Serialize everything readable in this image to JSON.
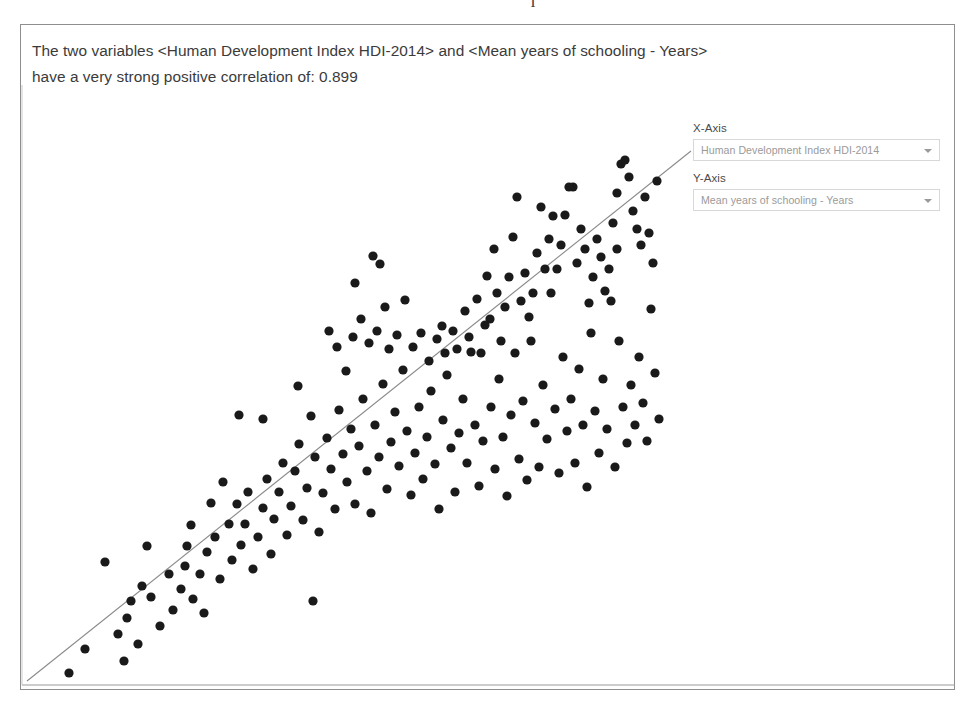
{
  "scan_artifact": "I",
  "header": {
    "correlation_text": "The two variables <Human Development Index HDI-2014> and <Mean years of schooling - Years> have a very strong positive correlation of: 0.899",
    "variable_x": "Human Development Index HDI-2014",
    "variable_y": "Mean years of schooling - Years",
    "correlation_value": "0.899",
    "correlation_strength": "very strong positive"
  },
  "controls": {
    "x_axis": {
      "label": "X-Axis",
      "selected": "Human Development Index HDI-2014",
      "arrow_icon": "chevron-down-icon"
    },
    "y_axis": {
      "label": "Y-Axis",
      "selected": "Mean years of schooling - Years",
      "arrow_icon": "chevron-down-icon"
    }
  },
  "colors": {
    "panel_border": "#8e8e8e",
    "text": "#3b3b3b",
    "marker": "#1a1a1a",
    "trendline": "#8a8a8a",
    "axis": "#9a9a9a",
    "select_border": "#d8d8d8",
    "select_text": "#9a9a9a"
  },
  "chart_data": {
    "type": "scatter",
    "title": "",
    "xlabel": "Human Development Index HDI-2014",
    "ylabel": "Mean years of schooling - Years",
    "correlation": 0.899,
    "grid": false,
    "legend": false,
    "axes": {
      "x_axis_visible": true,
      "y_axis_visible": true,
      "tick_labels": false
    },
    "marker": {
      "shape": "circle",
      "radius_px": 4.6,
      "color": "#1a1a1a"
    },
    "trendline": {
      "visible": true,
      "color": "#8a8a8a",
      "width_px": 1.1,
      "px_start": [
        26,
        680
      ],
      "px_end": [
        690,
        150
      ]
    },
    "plot_px_box": {
      "left": 20,
      "top": 84,
      "right": 955,
      "bottom": 685
    },
    "n_points": 196,
    "points_px": [
      [
        68,
        672
      ],
      [
        84,
        648
      ],
      [
        123,
        660
      ],
      [
        126,
        617
      ],
      [
        130,
        600
      ],
      [
        104,
        561
      ],
      [
        117,
        633
      ],
      [
        137,
        643
      ],
      [
        141,
        585
      ],
      [
        150,
        596
      ],
      [
        159,
        625
      ],
      [
        146,
        545
      ],
      [
        168,
        573
      ],
      [
        172,
        609
      ],
      [
        180,
        588
      ],
      [
        184,
        565
      ],
      [
        186,
        545
      ],
      [
        190,
        524
      ],
      [
        192,
        598
      ],
      [
        199,
        573
      ],
      [
        203,
        612
      ],
      [
        206,
        551
      ],
      [
        210,
        502
      ],
      [
        214,
        536
      ],
      [
        219,
        578
      ],
      [
        222,
        481
      ],
      [
        228,
        523
      ],
      [
        231,
        559
      ],
      [
        236,
        503
      ],
      [
        240,
        544
      ],
      [
        244,
        523
      ],
      [
        238,
        414
      ],
      [
        247,
        491
      ],
      [
        252,
        568
      ],
      [
        257,
        536
      ],
      [
        262,
        507
      ],
      [
        266,
        478
      ],
      [
        270,
        553
      ],
      [
        273,
        518
      ],
      [
        278,
        491
      ],
      [
        262,
        418
      ],
      [
        282,
        462
      ],
      [
        286,
        534
      ],
      [
        290,
        505
      ],
      [
        294,
        470
      ],
      [
        298,
        443
      ],
      [
        302,
        519
      ],
      [
        306,
        487
      ],
      [
        310,
        415
      ],
      [
        297,
        385
      ],
      [
        314,
        456
      ],
      [
        318,
        531
      ],
      [
        312,
        600
      ],
      [
        322,
        492
      ],
      [
        326,
        437
      ],
      [
        330,
        468
      ],
      [
        334,
        508
      ],
      [
        338,
        409
      ],
      [
        342,
        453
      ],
      [
        346,
        481
      ],
      [
        350,
        428
      ],
      [
        354,
        503
      ],
      [
        345,
        370
      ],
      [
        358,
        445
      ],
      [
        362,
        398
      ],
      [
        366,
        470
      ],
      [
        370,
        512
      ],
      [
        374,
        424
      ],
      [
        378,
        456
      ],
      [
        382,
        383
      ],
      [
        372,
        255
      ],
      [
        386,
        488
      ],
      [
        390,
        441
      ],
      [
        394,
        411
      ],
      [
        398,
        465
      ],
      [
        354,
        282
      ],
      [
        402,
        369
      ],
      [
        406,
        430
      ],
      [
        410,
        494
      ],
      [
        414,
        452
      ],
      [
        418,
        406
      ],
      [
        379,
        263
      ],
      [
        422,
        478
      ],
      [
        426,
        436
      ],
      [
        430,
        390
      ],
      [
        434,
        463
      ],
      [
        438,
        508
      ],
      [
        442,
        419
      ],
      [
        446,
        374
      ],
      [
        450,
        447
      ],
      [
        404,
        299
      ],
      [
        454,
        491
      ],
      [
        458,
        432
      ],
      [
        462,
        398
      ],
      [
        466,
        462
      ],
      [
        441,
        325
      ],
      [
        470,
        351
      ],
      [
        474,
        424
      ],
      [
        478,
        485
      ],
      [
        482,
        440
      ],
      [
        486,
        275
      ],
      [
        490,
        406
      ],
      [
        494,
        468
      ],
      [
        498,
        378
      ],
      [
        502,
        436
      ],
      [
        489,
        318
      ],
      [
        506,
        495
      ],
      [
        510,
        414
      ],
      [
        514,
        352
      ],
      [
        518,
        458
      ],
      [
        522,
        400
      ],
      [
        526,
        479
      ],
      [
        493,
        248
      ],
      [
        530,
        340
      ],
      [
        534,
        422
      ],
      [
        538,
        466
      ],
      [
        542,
        384
      ],
      [
        546,
        438
      ],
      [
        550,
        292
      ],
      [
        554,
        408
      ],
      [
        558,
        472
      ],
      [
        562,
        356
      ],
      [
        566,
        430
      ],
      [
        570,
        398
      ],
      [
        552,
        215
      ],
      [
        574,
        462
      ],
      [
        578,
        368
      ],
      [
        582,
        424
      ],
      [
        586,
        486
      ],
      [
        590,
        332
      ],
      [
        572,
        186
      ],
      [
        594,
        410
      ],
      [
        598,
        452
      ],
      [
        602,
        378
      ],
      [
        606,
        428
      ],
      [
        610,
        300
      ],
      [
        614,
        466
      ],
      [
        618,
        340
      ],
      [
        622,
        406
      ],
      [
        626,
        442
      ],
      [
        596,
        238
      ],
      [
        630,
        384
      ],
      [
        634,
        424
      ],
      [
        638,
        356
      ],
      [
        642,
        402
      ],
      [
        616,
        192
      ],
      [
        646,
        440
      ],
      [
        650,
        308
      ],
      [
        654,
        372
      ],
      [
        658,
        418
      ],
      [
        620,
        163
      ],
      [
        624,
        159
      ],
      [
        628,
        176
      ],
      [
        632,
        210
      ],
      [
        636,
        228
      ],
      [
        640,
        244
      ],
      [
        644,
        196
      ],
      [
        648,
        232
      ],
      [
        652,
        262
      ],
      [
        656,
        180
      ],
      [
        612,
        222
      ],
      [
        616,
        248
      ],
      [
        608,
        268
      ],
      [
        604,
        290
      ],
      [
        600,
        256
      ],
      [
        592,
        276
      ],
      [
        588,
        302
      ],
      [
        584,
        248
      ],
      [
        580,
        228
      ],
      [
        576,
        262
      ],
      [
        568,
        186
      ],
      [
        564,
        214
      ],
      [
        560,
        244
      ],
      [
        556,
        268
      ],
      [
        548,
        238
      ],
      [
        544,
        268
      ],
      [
        540,
        206
      ],
      [
        536,
        252
      ],
      [
        532,
        292
      ],
      [
        528,
        316
      ],
      [
        524,
        272
      ],
      [
        520,
        300
      ],
      [
        516,
        196
      ],
      [
        512,
        236
      ],
      [
        508,
        276
      ],
      [
        504,
        306
      ],
      [
        500,
        340
      ],
      [
        496,
        292
      ],
      [
        484,
        324
      ],
      [
        480,
        352
      ],
      [
        476,
        298
      ],
      [
        468,
        336
      ],
      [
        464,
        310
      ],
      [
        456,
        348
      ],
      [
        452,
        330
      ],
      [
        444,
        352
      ],
      [
        436,
        338
      ],
      [
        428,
        360
      ],
      [
        420,
        332
      ],
      [
        412,
        346
      ],
      [
        396,
        334
      ],
      [
        388,
        348
      ],
      [
        384,
        306
      ],
      [
        376,
        330
      ],
      [
        368,
        342
      ],
      [
        360,
        318
      ],
      [
        352,
        336
      ],
      [
        336,
        346
      ],
      [
        328,
        330
      ]
    ]
  }
}
